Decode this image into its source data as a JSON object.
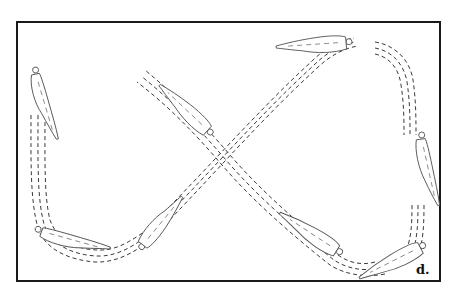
{
  "figure": {
    "label": "d.",
    "colors": {
      "frame": "#1a1a1a",
      "path": "#3a3a3a",
      "background": "#ffffff"
    }
  }
}
